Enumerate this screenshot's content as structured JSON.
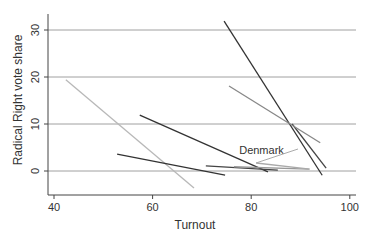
{
  "chart_data": {
    "type": "line",
    "title": "",
    "xlabel": "Turnout",
    "ylabel": "Radical Right vote share",
    "xlim": [
      38,
      101
    ],
    "ylim": [
      -5,
      34
    ],
    "xticks": [
      40,
      60,
      80,
      100
    ],
    "yticks": [
      0,
      10,
      20,
      30
    ],
    "grid": "horizontal",
    "legend": null,
    "annotations": [
      {
        "text": "Denmark",
        "x": 80,
        "y": 4.5
      }
    ],
    "series": [
      {
        "name": "line-light-gray",
        "color": "#b8b8b8",
        "x": [
          42.4,
          68.4
        ],
        "y": [
          19.4,
          -3.6
        ]
      },
      {
        "name": "line-dark-1",
        "color": "#333333",
        "x": [
          57.4,
          83.4
        ],
        "y": [
          11.9,
          -0.2
        ]
      },
      {
        "name": "line-dark-2",
        "color": "#333333",
        "x": [
          52.8,
          74.7
        ],
        "y": [
          3.6,
          -0.9
        ]
      },
      {
        "name": "line-steep-dark",
        "color": "#333333",
        "x": [
          74.5,
          94.4
        ],
        "y": [
          31.9,
          -0.9
        ]
      },
      {
        "name": "line-steep-dark-2",
        "color": "#444444",
        "x": [
          88.3,
          95.2
        ],
        "y": [
          10.0,
          0.6
        ]
      },
      {
        "name": "line-medium-gray",
        "color": "#888888",
        "x": [
          75.5,
          94.0
        ],
        "y": [
          18.1,
          6.0
        ]
      },
      {
        "name": "line-flat-dark",
        "color": "#444444",
        "x": [
          70.8,
          85.4
        ],
        "y": [
          1.1,
          0.2
        ]
      },
      {
        "name": "line-flat-gray",
        "color": "#999999",
        "x": [
          76.5,
          91.7
        ],
        "y": [
          0.9,
          0.4
        ]
      },
      {
        "name": "Denmark",
        "color": "#aaaaaa",
        "x": [
          81.0,
          91.9
        ],
        "y": [
          1.7,
          0.4
        ]
      }
    ]
  }
}
